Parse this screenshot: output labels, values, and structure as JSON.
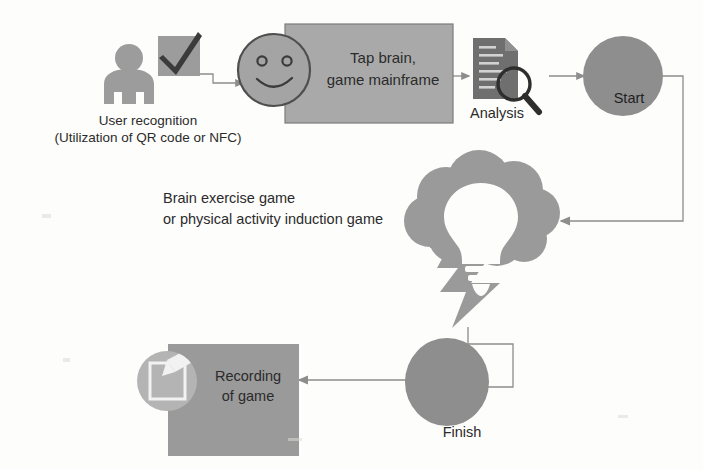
{
  "diagram": {
    "type": "process-flow",
    "background_color": "#fdfdfc",
    "palette": {
      "fill_light": "#aeaeae",
      "fill_mid": "#9a9a9a",
      "fill_dark": "#6f6f6f",
      "stroke": "#5c5c5c",
      "text": "#2b2b2b",
      "connector": "#8d8d8d"
    },
    "nodes": [
      {
        "id": "user-recognition",
        "icon": "person-icon",
        "secondary_icon": "checkmark-box-icon",
        "label_line1": "User recognition",
        "label_line2": "(Utilization of QR code or NFC)"
      },
      {
        "id": "tap-brain",
        "icon": "smiley-face-icon",
        "shape": "rectangle",
        "label_line1": "Tap brain,",
        "label_line2": "game mainframe"
      },
      {
        "id": "analysis",
        "icon": "document-magnifier-icon",
        "label": "Analysis"
      },
      {
        "id": "start",
        "shape": "circle",
        "label": "Start"
      },
      {
        "id": "brain-game",
        "icon": "brain-lightbulb-lightning-icon",
        "label_line1": "Brain exercise game",
        "label_line2": "or physical activity induction game"
      },
      {
        "id": "finish",
        "shape": "circle",
        "label": "Finish"
      },
      {
        "id": "recording",
        "icon": "notepad-pen-icon",
        "shape": "rectangle",
        "label_line1": "Recording",
        "label_line2": "of game"
      }
    ],
    "connectors": [
      {
        "id": "user-to-face",
        "from": "user-recognition",
        "to": "tap-brain",
        "style": "elbow-arrow"
      },
      {
        "id": "tap-to-analysis",
        "from": "tap-brain",
        "to": "analysis",
        "style": "straight-arrow"
      },
      {
        "id": "analysis-to-start",
        "from": "analysis",
        "to": "start",
        "style": "straight-arrow"
      },
      {
        "id": "start-to-braingame",
        "from": "start",
        "to": "brain-game",
        "style": "elbow-arrow"
      },
      {
        "id": "braingame-to-finish",
        "from": "brain-game",
        "to": "finish",
        "style": "elbow-arrow"
      },
      {
        "id": "finish-to-recording",
        "from": "finish",
        "to": "recording",
        "style": "straight-arrow"
      }
    ]
  }
}
